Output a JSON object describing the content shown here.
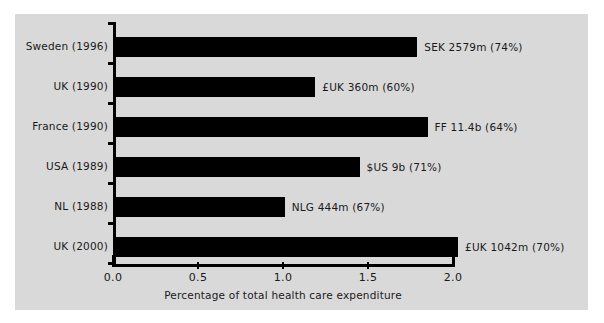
{
  "chart_data": {
    "type": "bar",
    "orientation": "horizontal",
    "title": "",
    "xlabel": "Percentage of total health care expenditure",
    "ylabel": "",
    "xlim": [
      0.0,
      2.0
    ],
    "xticks": [
      "0.0",
      "0.5",
      "1.0",
      "1.5",
      "2.0"
    ],
    "xtick_values": [
      0.0,
      0.5,
      1.0,
      1.5,
      2.0
    ],
    "grid": false,
    "legend": null,
    "bar_color": "#000000",
    "panel_color": "#d9d9d9",
    "categories": [
      "Sweden (1996)",
      "UK (1990)",
      "France (1990)",
      "USA (1989)",
      "NL (1988)",
      "UK (2000)"
    ],
    "values": [
      1.79,
      1.19,
      1.85,
      1.45,
      1.01,
      2.03
    ],
    "annotations": [
      "SEK 2579m (74%)",
      "£UK 360m (60%)",
      "FF 11.4b (64%)",
      "$US 9b (71%)",
      "NLG 444m (67%)",
      "£UK 1042m (70%)"
    ]
  }
}
